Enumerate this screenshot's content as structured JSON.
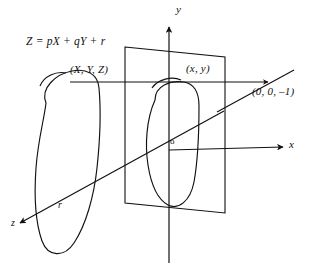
{
  "figure": {
    "stroke_color": "#111111",
    "background_color": "#ffffff",
    "labels": {
      "equation": "Z = pX + qY + r",
      "world_point": "(X, Y, Z)",
      "image_point": "(x, y)",
      "projection_center": "(0, 0, –1)",
      "axis_y": "y",
      "axis_x": "x",
      "axis_z": "z",
      "origin": "o",
      "offset_r": "r"
    }
  },
  "geometry": {
    "image_plane": {
      "shape": "parallelogram",
      "points": "125,47 225,57 225,213 125,203"
    },
    "axes": {
      "y_axis": {
        "from": "169,24",
        "to": "169,263"
      },
      "x_axis": {
        "from": "169,150",
        "to": "286,146"
      },
      "z_axis": {
        "from": "222,112",
        "to": "22,225"
      }
    },
    "projection_ray": {
      "from": "217,112",
      "to": "290,72"
    },
    "sight_line": {
      "from": "70,82",
      "to": "271,82"
    }
  }
}
